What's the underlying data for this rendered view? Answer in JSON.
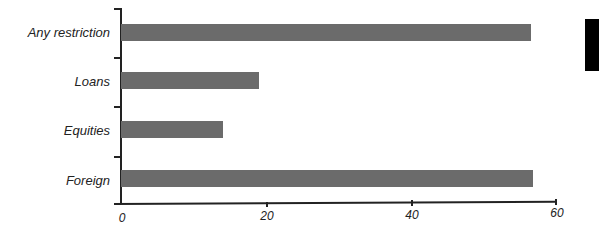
{
  "chart_data": {
    "type": "bar",
    "orientation": "horizontal",
    "title": "",
    "xlabel": "",
    "ylabel": "",
    "categories": [
      "Any restriction",
      "Loans",
      "Equities",
      "Foreign"
    ],
    "values": [
      56.6,
      19.1,
      14.1,
      56.8
    ],
    "xlim": [
      0,
      60
    ],
    "xticks": [
      "0",
      "20",
      "40",
      "60"
    ],
    "grid": false,
    "legend": null,
    "bar_color": "#6b6b6b"
  }
}
